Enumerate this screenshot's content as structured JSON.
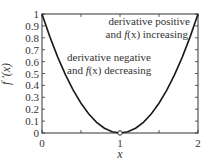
{
  "chart_data": {
    "type": "line",
    "title": "",
    "xlabel": "x",
    "ylabel": "f '(x)",
    "xlim": [
      0,
      2
    ],
    "ylim": [
      0,
      1
    ],
    "xticks": [
      "0",
      "1",
      "2"
    ],
    "yticks": [
      "0",
      "0.1",
      "0.2",
      "0.3",
      "0.4",
      "0.5",
      "0.6",
      "0.7",
      "0.8",
      "0.9",
      "1"
    ],
    "grid": false,
    "legend": null,
    "series": [
      {
        "name": "f '(x) = (x-1)^2",
        "x": [
          0,
          0.1,
          0.2,
          0.3,
          0.4,
          0.5,
          0.6,
          0.7,
          0.8,
          0.9,
          1.0,
          1.1,
          1.2,
          1.3,
          1.4,
          1.5,
          1.6,
          1.7,
          1.8,
          1.9,
          2.0
        ],
        "y": [
          1,
          0.81,
          0.64,
          0.49,
          0.36,
          0.25,
          0.16,
          0.09,
          0.04,
          0.01,
          0,
          0.01,
          0.04,
          0.09,
          0.16,
          0.25,
          0.36,
          0.49,
          0.64,
          0.81,
          1
        ]
      }
    ],
    "markers": [
      {
        "x": 1,
        "y": 0,
        "shape": "open-circle"
      }
    ],
    "annotations": [
      {
        "lines": [
          "derivative positive",
          "and f(x) increasing"
        ],
        "x": 1.55,
        "y": 0.87
      },
      {
        "lines": [
          "derivative negative",
          "and f(x) decreasing"
        ],
        "x": 0.75,
        "y": 0.63
      }
    ]
  },
  "labels": {
    "xlabel": "x",
    "ylabel": "f '(x)",
    "annot_pos_1": "derivative positive",
    "annot_pos_2_pre": "and ",
    "annot_pos_2_fx": "f",
    "annot_pos_2_post": "(x) increasing",
    "annot_neg_1": "derivative negative",
    "annot_neg_2_pre": "and ",
    "annot_neg_2_fx": "f",
    "annot_neg_2_post": "(x) decreasing"
  }
}
